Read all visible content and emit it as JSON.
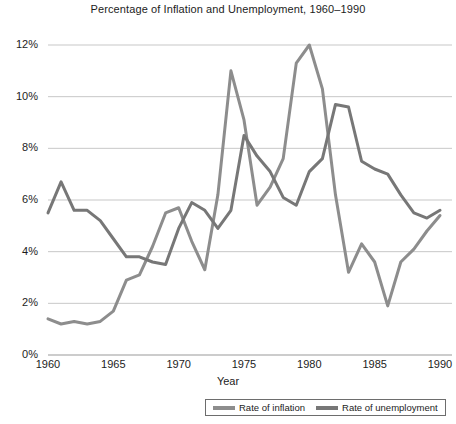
{
  "chart_data": {
    "type": "line",
    "title": "Percentage of Inflation and Unemployment, 1960–1990",
    "xlabel": "Year",
    "ylabel": "",
    "xlim": [
      1960,
      1990
    ],
    "ylim": [
      0,
      12
    ],
    "grid": true,
    "legend_position": "bottom",
    "x": [
      1960,
      1961,
      1962,
      1963,
      1964,
      1965,
      1966,
      1967,
      1968,
      1969,
      1970,
      1971,
      1972,
      1973,
      1974,
      1975,
      1976,
      1977,
      1978,
      1979,
      1980,
      1981,
      1982,
      1983,
      1984,
      1985,
      1986,
      1987,
      1988,
      1989,
      1990
    ],
    "ytick_labels": [
      "0%",
      "2%",
      "4%",
      "6%",
      "8%",
      "10%",
      "12%"
    ],
    "ytick_values": [
      0,
      2,
      4,
      6,
      8,
      10,
      12
    ],
    "xtick_labels": [
      "1960",
      "1965",
      "1970",
      "1975",
      "1980",
      "1985",
      "1990"
    ],
    "xtick_values": [
      1960,
      1965,
      1970,
      1975,
      1980,
      1985,
      1990
    ],
    "series": [
      {
        "name": "Rate of inflation",
        "color": "#8d8d8d",
        "values": [
          1.4,
          1.2,
          1.3,
          1.2,
          1.3,
          1.7,
          2.9,
          3.1,
          4.2,
          5.5,
          5.7,
          4.4,
          3.2,
          6.2,
          11.0,
          9.1,
          5.8,
          6.5,
          7.6,
          11.3,
          13.5,
          10.3,
          6.2,
          3.2,
          4.3,
          3.6,
          1.9,
          3.6,
          4.1,
          4.8,
          5.4
        ]
      },
      {
        "name": "Rate of unemployment",
        "color": "#777777",
        "values": [
          5.5,
          6.7,
          5.6,
          5.6,
          5.2,
          4.5,
          3.8,
          3.8,
          3.6,
          3.5,
          4.9,
          5.9,
          5.6,
          4.9,
          5.6,
          8.5,
          7.7,
          7.1,
          6.1,
          5.8,
          7.1,
          7.6,
          9.7,
          9.6,
          7.5,
          7.2,
          7.0,
          6.2,
          5.5,
          5.3,
          5.6
        ]
      }
    ],
    "display_paths": {
      "note": "visual polyline values as read from the rendered image",
      "inflation": [
        1.4,
        1.2,
        1.3,
        1.2,
        1.3,
        1.7,
        2.9,
        3.1,
        4.2,
        5.5,
        5.7,
        4.4,
        3.3,
        6.2,
        11.0,
        9.1,
        5.8,
        6.5,
        7.6,
        11.3,
        13.5,
        10.3,
        6.2,
        3.2,
        4.3,
        3.6,
        1.9,
        3.6,
        4.1,
        4.8,
        5.4
      ],
      "unemployment": [
        5.5,
        6.7,
        5.6,
        5.6,
        5.2,
        4.5,
        3.8,
        3.8,
        3.6,
        3.5,
        4.9,
        5.9,
        5.6,
        4.9,
        5.6,
        8.5,
        7.7,
        7.1,
        6.1,
        5.8,
        7.1,
        7.6,
        9.7,
        9.6,
        7.5,
        7.2,
        7.0,
        6.2,
        5.5,
        5.3,
        5.6
      ]
    }
  },
  "legend": {
    "items": [
      {
        "label": "Rate of inflation",
        "color": "#8d8d8d"
      },
      {
        "label": "Rate of unemployment",
        "color": "#777777"
      }
    ]
  }
}
